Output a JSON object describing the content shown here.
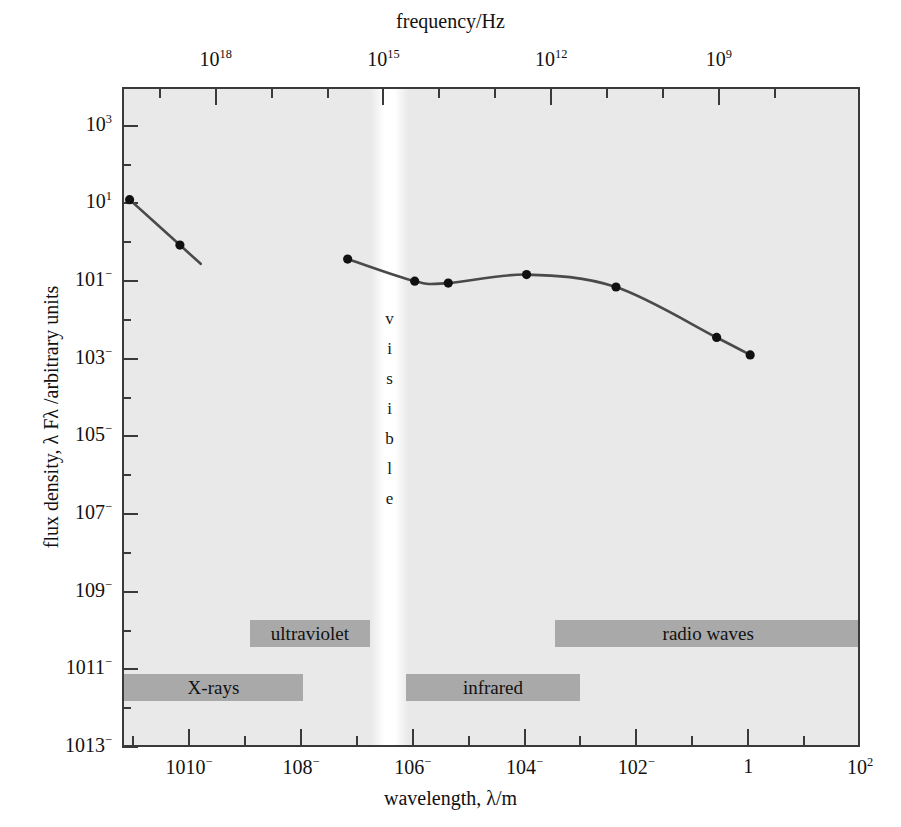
{
  "chart_data": {
    "type": "line",
    "title": "",
    "xlabel": "wavelength, λ/m",
    "ylabel": "flux density, λ Fλ /arbitrary units",
    "top_axis_label": "frequency/Hz",
    "xscale": "log",
    "yscale": "log",
    "xlim": [
      -11.2,
      2.0
    ],
    "ylim": [
      -13,
      4
    ],
    "top_xlim": [
      19.2,
      8.0
    ],
    "grid": false,
    "legend": null,
    "x_ticklabels": [
      "10−10",
      "10−8",
      "10−6",
      "10−4",
      "10−2",
      "1",
      "10²"
    ],
    "x_tickvalues": [
      -10,
      -8,
      -6,
      -4,
      -2,
      0,
      2
    ],
    "y_ticklabels": [
      "10³",
      "10¹",
      "10−1",
      "10−3",
      "10−5",
      "10−7",
      "10−9",
      "10−11",
      "10−13"
    ],
    "y_tickvalues": [
      3,
      1,
      -1,
      -3,
      -5,
      -7,
      -9,
      -11,
      -13
    ],
    "top_ticklabels": [
      "10¹⁸",
      "10¹⁵",
      "10¹²",
      "10⁹"
    ],
    "top_tickvalues": [
      18,
      15,
      12,
      9
    ],
    "series": [
      {
        "name": "x-ray segment",
        "x": [
          -11.1,
          -10.2
        ],
        "y": [
          1.15,
          -0.02
        ],
        "points": [
          [
            -11.1,
            1.15
          ],
          [
            -10.2,
            -0.02
          ]
        ]
      },
      {
        "name": "infrared-radio segment",
        "x": [
          -7.2,
          -6.0,
          -5.4,
          -4.0,
          -2.4,
          -0.6,
          0.0
        ],
        "y": [
          -0.38,
          -0.95,
          -1.0,
          -0.78,
          -1.1,
          -2.4,
          -2.85
        ],
        "points": [
          [
            -7.2,
            -0.38
          ],
          [
            -6.0,
            -0.95
          ],
          [
            -5.4,
            -1.0
          ],
          [
            -4.0,
            -0.78
          ],
          [
            -2.4,
            -1.1
          ],
          [
            -0.6,
            -2.4
          ],
          [
            0.0,
            -2.85
          ]
        ]
      }
    ],
    "annotations": [
      {
        "name": "visible",
        "text": "visible",
        "orientation": "vertical",
        "x_range": [
          -6.55,
          -6.35
        ]
      },
      {
        "name": "x-rays",
        "text": "X-rays",
        "row": "lower",
        "x_range": [
          -11.2,
          -8.0
        ]
      },
      {
        "name": "ultraviolet",
        "text": "ultraviolet",
        "row": "upper",
        "x_range": [
          -8.95,
          -6.8
        ]
      },
      {
        "name": "infrared",
        "text": "infrared",
        "row": "lower",
        "x_range": [
          -6.15,
          -3.05
        ]
      },
      {
        "name": "radio waves",
        "text": "radio waves",
        "row": "upper",
        "x_range": [
          -3.5,
          2.0
        ]
      }
    ],
    "colors": {
      "plot_background": "#e9e9e9",
      "band_fill": "#a9a9a9",
      "visible_band": "#ffffff",
      "curve": "#4a4a4a",
      "marker": "#111111",
      "frame": "#3a3a3a"
    }
  }
}
